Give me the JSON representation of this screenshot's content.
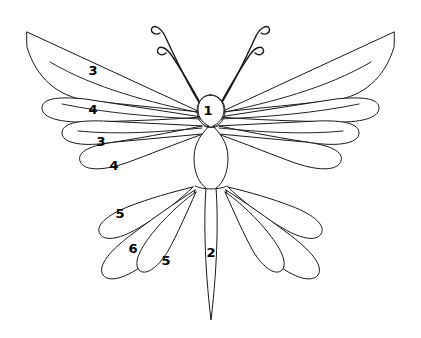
{
  "figure": {
    "background_color": "#ffffff",
    "line_color": "#1a1a1a",
    "label_color": "#000000",
    "width": 421,
    "height": 338
  },
  "labels": [
    {
      "id": "label-1",
      "text": "1",
      "x": 208,
      "y": 110,
      "part": "head"
    },
    {
      "id": "label-2",
      "text": "2",
      "x": 211,
      "y": 252,
      "part": "abdomen"
    },
    {
      "id": "label-3a",
      "text": "3",
      "x": 93,
      "y": 70,
      "part": "upper-forewing-outer"
    },
    {
      "id": "label-4a",
      "text": "4",
      "x": 93,
      "y": 109,
      "part": "upper-forewing-inner"
    },
    {
      "id": "label-3b",
      "text": "3",
      "x": 101,
      "y": 141,
      "part": "mid-wing-upper"
    },
    {
      "id": "label-4b",
      "text": "4",
      "x": 114,
      "y": 165,
      "part": "mid-wing-lower"
    },
    {
      "id": "label-5a",
      "text": "5",
      "x": 120,
      "y": 213,
      "part": "hindwing-outer"
    },
    {
      "id": "label-6",
      "text": "6",
      "x": 133,
      "y": 248,
      "part": "hindwing-middle"
    },
    {
      "id": "label-5b",
      "text": "5",
      "x": 166,
      "y": 260,
      "part": "hindwing-inner"
    }
  ],
  "parts": {
    "head": "1",
    "abdomen": "2",
    "wing_segment_a": "3",
    "wing_segment_b": "4",
    "hindwing_petal": "5",
    "hindwing_large": "6"
  },
  "counts": {
    "antennae": 4,
    "upper_petals_per_side": 4,
    "lower_petals_per_side": 3
  }
}
